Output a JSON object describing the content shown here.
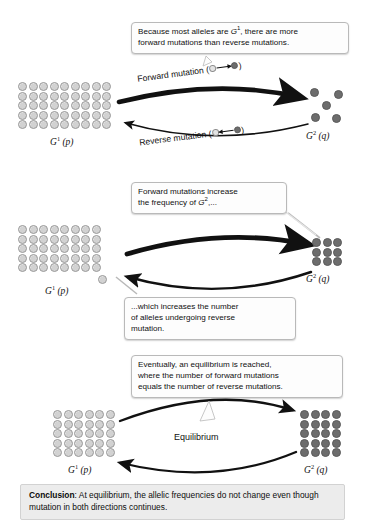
{
  "figure": {
    "conclusion_label": "Conclusion",
    "conclusion_text": ": At equilibrium, the allelic frequencies do not change even though mutation in both directions continues.",
    "colors": {
      "light_allele_fill": "#d2d2d2",
      "light_allele_stroke": "#9a9a9a",
      "dark_allele_fill": "#6d6d6d",
      "dark_allele_stroke": "#5a5a5a",
      "callout_background": "#fdfdfd",
      "callout_border": "#b9b9b9",
      "conclusion_background": "#ececec",
      "arrow_color": "#000000",
      "page_background": "#ffffff"
    }
  },
  "panels": [
    {
      "id": "panel-1",
      "left_population": {
        "genotype": "G",
        "superscript": "1",
        "frequency": "(p)",
        "allele_type": "light",
        "columns": 9,
        "rows": 5,
        "count": 45
      },
      "right_population": {
        "genotype": "G",
        "superscript": "2",
        "frequency": "(q)",
        "allele_type": "dark",
        "layout": "quincunx",
        "count": 5
      },
      "forward_arrow_label": "Forward mutation (",
      "forward_arrow_label_close": ")",
      "reverse_arrow_label": "Reverse mutation (",
      "reverse_arrow_label_close": ")",
      "callout": {
        "line1_a": "Because most alleles are ",
        "line1_sup_base": "G",
        "line1_sup": "1",
        "line1_b": ", there are more",
        "line2": "forward mutations than reverse mutations."
      }
    },
    {
      "id": "panel-2",
      "left_population": {
        "genotype": "G",
        "superscript": "1",
        "frequency": "(p)",
        "allele_type": "light",
        "columns": 8,
        "rows": 5,
        "count": 41
      },
      "right_population": {
        "genotype": "G",
        "superscript": "2",
        "frequency": "(q)",
        "allele_type": "dark",
        "columns": 3,
        "rows": 3,
        "count": 9
      },
      "callout_top": {
        "line1": "Forward mutations increase",
        "line2_a": "the frequency of ",
        "line2_sup_base": "G",
        "line2_sup": "2",
        "line2_b": ",..."
      },
      "callout_bottom": {
        "line1": "...which increases the number",
        "line2": "of alleles undergoing reverse",
        "line3": "mutation."
      }
    },
    {
      "id": "panel-3",
      "left_population": {
        "genotype": "G",
        "superscript": "1",
        "frequency": "(p)",
        "allele_type": "light",
        "columns": 6,
        "rows": 5,
        "count": 30
      },
      "right_population": {
        "genotype": "G",
        "superscript": "2",
        "frequency": "(q)",
        "allele_type": "dark",
        "columns": 4,
        "rows": 5,
        "count": 20
      },
      "equilibrium_label": "Equilibrium",
      "callout": {
        "line1": "Eventually, an equilibrium is reached,",
        "line2": "where the number of forward mutations",
        "line3": "equals the number of reverse mutations."
      }
    }
  ]
}
